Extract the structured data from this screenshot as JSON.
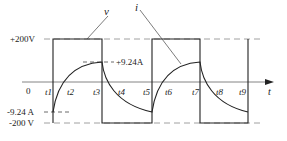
{
  "diagram": {
    "type": "waveform",
    "curve_labels": {
      "voltage": "v",
      "current": "i"
    },
    "y_labels": {
      "v_max": "+200V",
      "v_min": "-200 V",
      "i_max": "+9.24A",
      "i_min": "-9.24 A"
    },
    "x_axis": {
      "origin": "0",
      "axis_label": "t",
      "ticks": [
        "t1",
        "t2",
        "t3",
        "t4",
        "t5",
        "t6",
        "t7",
        "t8",
        "t9"
      ]
    },
    "colors": {
      "line": "#222222",
      "dashed": "#888888"
    }
  }
}
